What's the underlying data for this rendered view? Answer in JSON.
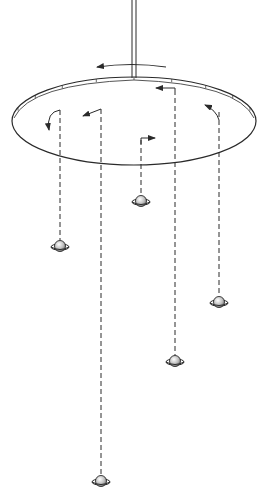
{
  "diagram": {
    "colors": {
      "ink": "#2a2a2a",
      "background": "#ffffff",
      "planet_fill": "#bdbdbd"
    },
    "shaft": {
      "x": 134,
      "y_top": 0,
      "y_bottom": 78
    },
    "disk": {
      "cx": 134,
      "cy": 121,
      "rx": 122,
      "ry": 44,
      "rim_ticks": 9
    },
    "main_rotation_arrow": {
      "direction": "counterclockwise",
      "from_x": 166,
      "to_x": 96,
      "y": 67
    },
    "strings": [
      {
        "id": "string-1",
        "x": 60,
        "y_top": 110,
        "planet_y": 246,
        "arrow": "curl-down-left"
      },
      {
        "id": "string-2",
        "x": 101,
        "y_top": 109,
        "planet_y": 481,
        "arrow": "left"
      },
      {
        "id": "string-3",
        "x": 141,
        "y_top": 140,
        "planet_y": 201,
        "arrow": "right"
      },
      {
        "id": "string-4",
        "x": 175,
        "y_top": 90,
        "planet_y": 361,
        "arrow": "left"
      },
      {
        "id": "string-5",
        "x": 219,
        "y_top": 112,
        "planet_y": 302,
        "arrow": "up-left"
      }
    ],
    "planet_icon": "saturn-icon"
  },
  "caption_fragment": ""
}
